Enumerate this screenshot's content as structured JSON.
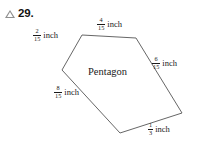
{
  "problem": {
    "marker_icon": "triangle-outline-icon",
    "number": "29."
  },
  "figure": {
    "interior_label": "Pentagon",
    "stroke_color": "#555555",
    "sides": [
      {
        "id": "top-left-side",
        "numerator": "2",
        "denominator": "15",
        "unit": "inch",
        "x": 33,
        "y": 28
      },
      {
        "id": "top-side",
        "numerator": "4",
        "denominator": "15",
        "unit": "inch",
        "x": 97,
        "y": 17
      },
      {
        "id": "right-side",
        "numerator": "6",
        "denominator": "15",
        "unit": "inch",
        "x": 152,
        "y": 56
      },
      {
        "id": "left-side",
        "numerator": "8",
        "denominator": "15",
        "unit": "inch",
        "x": 54,
        "y": 85
      },
      {
        "id": "bottom-right-side",
        "numerator": "1",
        "denominator": "3",
        "unit": "inch",
        "x": 148,
        "y": 122
      }
    ],
    "vertices": "82,35 136,38 182,113 120,133 62,70"
  }
}
